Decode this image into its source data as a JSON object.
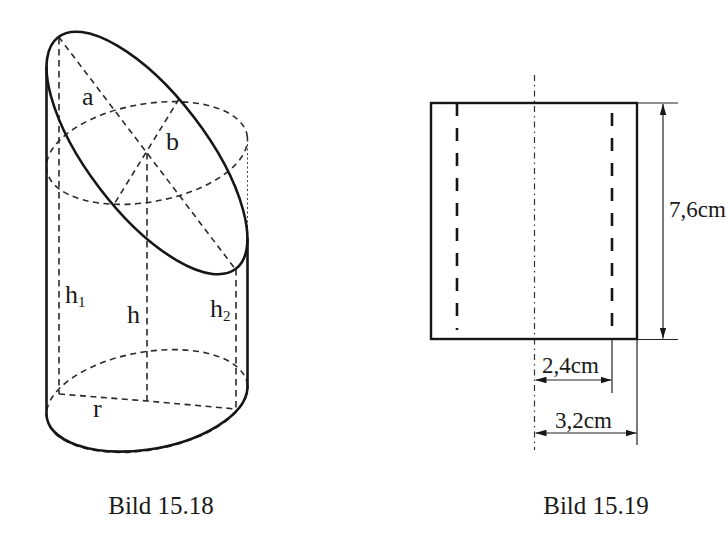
{
  "figures": [
    {
      "caption": "Bild 15.18",
      "labels": {
        "a": "a",
        "b": "b",
        "h1": {
          "main": "h",
          "sub": "1"
        },
        "h": "h",
        "h2": {
          "main": "h",
          "sub": "2"
        },
        "r": "r"
      }
    },
    {
      "caption": "Bild 15.19",
      "dimensions": {
        "height": "7,6cm",
        "inner_offset": "2,4cm",
        "outer_offset": "3,2cm"
      }
    }
  ]
}
